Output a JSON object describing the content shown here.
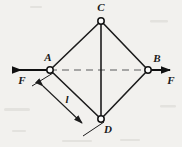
{
  "figure": {
    "type": "mechanics-free-body-diagram",
    "background_color": "#f2f1ee",
    "line_color": "#1c1c1c",
    "dash_color": "#8d8d8d"
  },
  "nodes": [
    {
      "id": "C",
      "label": "C",
      "x": 101,
      "y": 21,
      "label_x": 101,
      "label_y": 11,
      "label_anchor": "middle",
      "joint": true
    },
    {
      "id": "A",
      "label": "A",
      "x": 50,
      "y": 70,
      "label_x": 48,
      "label_y": 61,
      "label_anchor": "middle",
      "joint": true
    },
    {
      "id": "B",
      "label": "B",
      "x": 148,
      "y": 70,
      "label_x": 157,
      "label_y": 62,
      "label_anchor": "middle",
      "joint": true
    },
    {
      "id": "D",
      "label": "D",
      "x": 101,
      "y": 119,
      "label_x": 108,
      "label_y": 133,
      "label_anchor": "middle",
      "joint": true
    }
  ],
  "members": [
    {
      "from": "A",
      "to": "C",
      "style": "solid"
    },
    {
      "from": "C",
      "to": "B",
      "style": "solid"
    },
    {
      "from": "B",
      "to": "D",
      "style": "solid"
    },
    {
      "from": "D",
      "to": "A",
      "style": "solid"
    },
    {
      "from": "C",
      "to": "D",
      "style": "solid"
    }
  ],
  "axis": {
    "name": "horizontal-center-axis",
    "style": "dashed",
    "from_x": 50,
    "from_y": 70,
    "to_x": 148,
    "to_y": 70
  },
  "forces": [
    {
      "id": "force-left",
      "label": "F",
      "applied_at": "A",
      "direction": "left",
      "tail_x": 50,
      "tail_y": 70,
      "tip_x": 7,
      "tip_y": 70,
      "label_x": 22,
      "label_y": 84
    },
    {
      "id": "force-right",
      "label": "F",
      "applied_at": "B",
      "direction": "right",
      "tail_x": 148,
      "tail_y": 70,
      "tip_x": 176,
      "tip_y": 70,
      "label_x": 171,
      "label_y": 84
    }
  ],
  "dimension": {
    "id": "length-AD",
    "label": "l",
    "label_x": 67,
    "label_y": 103,
    "measures": "A-D",
    "start_x": 37,
    "start_y": 80,
    "end_x": 88,
    "end_y": 129,
    "extension_from_A": {
      "x1": 53,
      "y1": 73,
      "x2": 32,
      "y2": 86
    },
    "extension_from_D": {
      "x1": 104,
      "y1": 122,
      "x2": 83,
      "y2": 136
    }
  }
}
